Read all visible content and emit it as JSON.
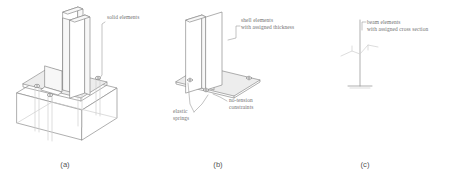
{
  "figure": {
    "background_color": "#ffffff",
    "line_color": "#8d8d8d",
    "faint_line_color": "#cfcfcf",
    "text_color": "#6f6f6f",
    "caption_color": "#555555"
  },
  "panels": [
    {
      "id": "a",
      "caption": "(a)",
      "annotations": [
        {
          "name": "solid-elements",
          "text": "solid elements"
        }
      ]
    },
    {
      "id": "b",
      "caption": "(b)",
      "annotations": [
        {
          "name": "shell-elements",
          "text": "shell elements\nwith assigned thickness"
        },
        {
          "name": "no-tension-constraints",
          "text": "no-tension\nconstraints"
        },
        {
          "name": "elastic-springs",
          "text": "elastic\nsprings"
        }
      ]
    },
    {
      "id": "c",
      "caption": "(c)",
      "annotations": [
        {
          "name": "beam-elements",
          "text": "beam elements\nwith assigned cross section"
        }
      ]
    }
  ],
  "labels": {
    "solid_elements": "solid elements",
    "shell_elements": "shell elements\nwith assigned thickness",
    "no_tension_constraints": "no-tension\nconstraints",
    "elastic_springs": "elastic\nsprings",
    "beam_elements": "beam elements\nwith assigned cross section",
    "caption_a": "(a)",
    "caption_b": "(b)",
    "caption_c": "(c)"
  }
}
